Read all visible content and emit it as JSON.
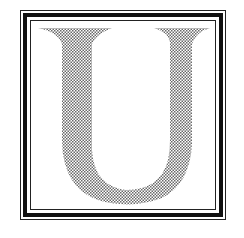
{
  "illustration": {
    "letter": "U",
    "style": "stippled serif initial in triple-line frame",
    "colors": {
      "frame": "#111111",
      "stipple": "#777777",
      "background": "#ffffff"
    }
  }
}
